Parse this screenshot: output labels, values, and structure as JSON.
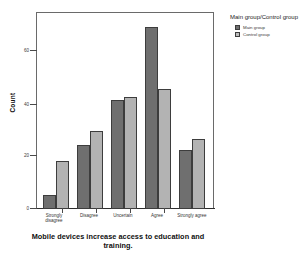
{
  "chart_data": {
    "type": "bar",
    "title": "",
    "subtitle": "",
    "xlabel": "Mobile  devices increase access to education and training.",
    "ylabel": "Count",
    "categories": [
      "Strongly disagree",
      "Disagree",
      "Uncertain",
      "Agree",
      "Strongly agree"
    ],
    "series": [
      {
        "name": "Main group",
        "values": [
          5,
          23,
          39,
          65,
          21
        ],
        "color": "#6f6f6f"
      },
      {
        "name": "Control group",
        "values": [
          17,
          28,
          40,
          43,
          25
        ],
        "color": "#b3b3b3"
      }
    ],
    "ylim": [
      0,
      70
    ],
    "yticks": [
      0,
      20,
      40,
      60
    ],
    "ytick_labels": [
      "0",
      "20",
      "40",
      "60"
    ],
    "grid": false,
    "legend_position": "right",
    "legend_title": "Main group/Control group"
  },
  "axes": {
    "y_title": "Count",
    "x_title": "Mobile  devices increase access to education and training.",
    "y_ticks": [
      {
        "value": 60,
        "label": "60"
      },
      {
        "value": 40,
        "label": "40"
      },
      {
        "value": 20,
        "label": "20"
      },
      {
        "value": 0,
        "label": "0"
      }
    ],
    "x_categories": [
      {
        "label": "Strongly disagree"
      },
      {
        "label": "Disagree"
      },
      {
        "label": "Uncertain"
      },
      {
        "label": "Agree"
      },
      {
        "label": "Strongly agree"
      }
    ]
  },
  "legend": {
    "title": "Main group/Control group",
    "items": [
      {
        "label": "Main group",
        "color": "#6f6f6f"
      },
      {
        "label": "Control group",
        "color": "#bdbdbd"
      }
    ]
  }
}
